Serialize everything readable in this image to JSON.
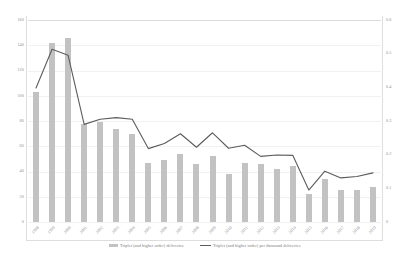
{
  "chart_data": {
    "type": "bar",
    "title": "",
    "subtitle": "",
    "xlabel": "",
    "ylabel": "",
    "y2label": "",
    "grid": true,
    "legend_position": "bottom-center",
    "categories": [
      "1998",
      "1999",
      "2000",
      "2001",
      "2002",
      "2003",
      "2004",
      "2005",
      "2006",
      "2007",
      "2008",
      "2009",
      "2010",
      "2011",
      "2012",
      "2013",
      "2014",
      "2015",
      "2016",
      "2017",
      "2018",
      "2019"
    ],
    "ylim": [
      0,
      160
    ],
    "y_ticks": [
      "0",
      "20",
      "40",
      "60",
      "80",
      "100",
      "120",
      "140",
      "160"
    ],
    "y2lim": [
      0,
      0.6
    ],
    "y2_ticks": [
      "0",
      "0.1",
      "0.2",
      "0.3",
      "0.4",
      "0.5",
      "0.6"
    ],
    "series": [
      {
        "name": "Triplet (and higher order) deliveries",
        "type": "bar",
        "axis": "left",
        "color": "#c2c2c2",
        "values": [
          103,
          142,
          146,
          78,
          79,
          74,
          70,
          47,
          49,
          54,
          46,
          52,
          38,
          47,
          46,
          42,
          44,
          22,
          34,
          25,
          25,
          28
        ]
      },
      {
        "name": "Triplet (and higher order) per thousand deliveries",
        "type": "line",
        "axis": "right",
        "color": "#5c5c5c",
        "values": [
          0.398,
          0.513,
          0.495,
          0.29,
          0.305,
          0.31,
          0.305,
          0.218,
          0.233,
          0.262,
          0.222,
          0.265,
          0.219,
          0.228,
          0.195,
          0.199,
          0.198,
          0.095,
          0.151,
          0.131,
          0.135,
          0.146
        ]
      }
    ]
  },
  "legend": {
    "items": [
      {
        "label": "Triplet (and higher order) deliveries",
        "marker": "bar-swatch"
      },
      {
        "label": "Triplet (and higher order) per thousand deliveries",
        "marker": "line-swatch"
      }
    ]
  }
}
